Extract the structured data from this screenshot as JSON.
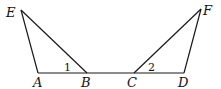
{
  "diagram": {
    "points": {
      "E": {
        "label": "E",
        "x": 21,
        "y": 10
      },
      "A": {
        "label": "A",
        "x": 38,
        "y": 73
      },
      "B": {
        "label": "B",
        "x": 87,
        "y": 73
      },
      "C": {
        "label": "C",
        "x": 134,
        "y": 73
      },
      "D": {
        "label": "D",
        "x": 184,
        "y": 72
      },
      "F": {
        "label": "F",
        "x": 201,
        "y": 9
      }
    },
    "segments": [
      "EA",
      "EB",
      "AD",
      "CF",
      "DF"
    ],
    "angles": {
      "angle1": {
        "label": "1",
        "at": "B"
      },
      "angle2": {
        "label": "2",
        "at": "C"
      }
    }
  }
}
